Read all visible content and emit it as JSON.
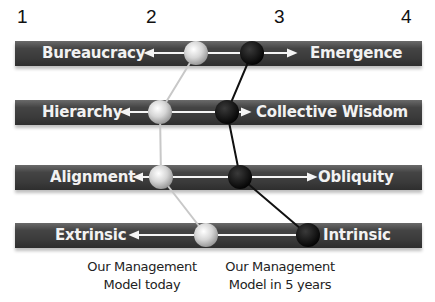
{
  "scale": {
    "ticks": [
      "1",
      "2",
      "3",
      "4"
    ]
  },
  "rows": [
    {
      "left_label": "Bureaucracy",
      "right_label": "Emergence"
    },
    {
      "left_label": "Hierarchy",
      "right_label": "Collective Wisdom"
    },
    {
      "left_label": "Alignment",
      "right_label": "Obliquity"
    },
    {
      "left_label": "Extrinsic",
      "right_label": "Intrinsic"
    }
  ],
  "legend": {
    "today": "Our Management\nModel today",
    "today_line1": "Our Management",
    "today_line2": "Model today",
    "future_line1": "Our Management",
    "future_line2": "Model in 5 years"
  },
  "series": [
    {
      "name": "Our Management Model today",
      "color": "#cfcfcf",
      "values": [
        2.35,
        2.07,
        2.08,
        2.43
      ]
    },
    {
      "name": "Our Management Model in 5 years",
      "color": "#111111",
      "values": [
        2.78,
        2.53,
        2.63,
        3.16
      ]
    }
  ]
}
